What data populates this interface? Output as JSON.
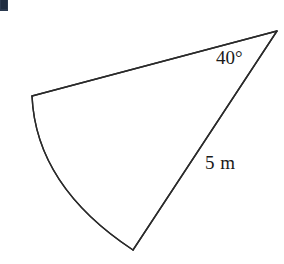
{
  "canvas": {
    "width": 284,
    "height": 264,
    "background_color": "#ffffff"
  },
  "figure": {
    "name": "circular-sector",
    "stroke_color": "#2a2a2a",
    "stroke_width": 1.4,
    "fill_color": "none",
    "vertices": {
      "apex": {
        "x": 277,
        "y": 31
      },
      "left": {
        "x": 32,
        "y": 96
      },
      "bottom": {
        "x": 133,
        "y": 250
      }
    },
    "edges": [
      {
        "name": "top-straight-edge",
        "type": "line",
        "from": "left",
        "to": "apex"
      },
      {
        "name": "radius-edge",
        "type": "line",
        "from": "bottom",
        "to": "apex",
        "label": "5 m"
      },
      {
        "name": "arc-edge",
        "type": "arc",
        "from": "left",
        "to": "bottom",
        "bulge": "outward-left"
      }
    ],
    "arc_control": {
      "x": 36,
      "y": 186
    }
  },
  "labels": {
    "angle": {
      "text": "40°",
      "value": 40,
      "unit": "degrees",
      "x": 216,
      "y": 48
    },
    "side": {
      "text": "5 m",
      "value": 5,
      "unit": "m",
      "x": 205,
      "y": 153
    }
  },
  "artifact": {
    "name": "top-left-corner-fragment",
    "color": "#2b3a4f"
  }
}
